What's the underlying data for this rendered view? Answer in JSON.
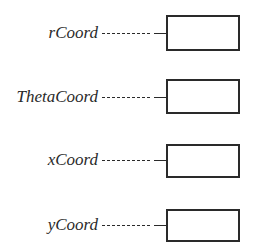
{
  "diagram": {
    "type": "variable-boxes",
    "variables": [
      {
        "name": "rCoord",
        "value": ""
      },
      {
        "name": "ThetaCoord",
        "value": ""
      },
      {
        "name": "xCoord",
        "value": ""
      },
      {
        "name": "yCoord",
        "value": ""
      }
    ]
  },
  "colors": {
    "ink": "#2a2a2a",
    "background": "#ffffff"
  }
}
